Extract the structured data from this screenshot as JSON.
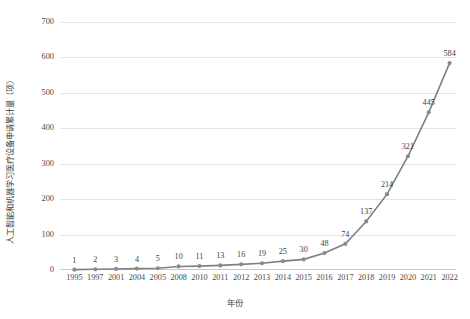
{
  "chart_data": {
    "type": "line",
    "title": "",
    "xlabel": "年份",
    "ylabel": "人工智能和机器学习医疗设备申请累计量（项）",
    "categories": [
      "1995",
      "1997",
      "2001",
      "2004",
      "2005",
      "2008",
      "2010",
      "2011",
      "2012",
      "2013",
      "2014",
      "2015",
      "2016",
      "2017",
      "2018",
      "2019",
      "2020",
      "2021",
      "2022"
    ],
    "values": [
      1,
      2,
      3,
      4,
      5,
      10,
      11,
      13,
      16,
      19,
      25,
      30,
      48,
      74,
      137,
      214,
      321,
      445,
      584
    ],
    "point_labels": [
      "1",
      "2",
      "3",
      "4",
      "5",
      "10",
      "11",
      "13",
      "16",
      "19",
      "25",
      "30",
      "48",
      "74",
      "137",
      "214",
      "321",
      "445",
      "584"
    ],
    "ylim": [
      0,
      700
    ],
    "y_ticks": [
      "0",
      "100",
      "200",
      "300",
      "400",
      "500",
      "600",
      "700"
    ],
    "y_tick_values": [
      0,
      100,
      200,
      300,
      400,
      500,
      600,
      700
    ],
    "grid": true,
    "legend": "none",
    "series_color": "#808080",
    "marker_color": "#8a8a8a",
    "grid_color": "#e4e4e4"
  }
}
